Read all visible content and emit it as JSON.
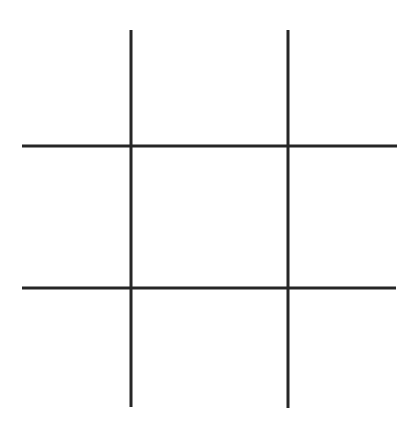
{
  "canvas": {
    "width": 414,
    "height": 429,
    "background_color": "#ffffff"
  },
  "board": {
    "name": "tic-tac-toe-grid",
    "rows": 3,
    "columns": 3,
    "marks_placed": 0,
    "state": "empty"
  },
  "style": {
    "line_color": "#262626",
    "line_width": 3,
    "line_cap": "butt"
  },
  "chart_data": {
    "type": "table",
    "title": "",
    "xlabel": "",
    "ylabel": "",
    "categories": [
      "column-left",
      "column-center",
      "column-right"
    ],
    "rows": [
      "row-top",
      "row-middle",
      "row-bottom"
    ],
    "cells": [
      [
        "",
        "",
        ""
      ],
      [
        "",
        "",
        ""
      ],
      [
        "",
        "",
        ""
      ]
    ],
    "grid": true,
    "legend": "none"
  },
  "lines": [
    {
      "name": "vertical-line-left",
      "orientation": "vertical",
      "x1": 131,
      "y1": 30,
      "x2": 131,
      "y2": 407
    },
    {
      "name": "vertical-line-right",
      "orientation": "vertical",
      "x1": 288,
      "y1": 30,
      "x2": 288,
      "y2": 408
    },
    {
      "name": "horizontal-line-top",
      "orientation": "horizontal",
      "x1": 22,
      "y1": 146,
      "x2": 397,
      "y2": 146
    },
    {
      "name": "horizontal-line-bottom",
      "orientation": "horizontal",
      "x1": 22,
      "y1": 288,
      "x2": 396,
      "y2": 288
    }
  ],
  "cells": [
    {
      "name": "cell-top-left",
      "mark": "",
      "x": 22,
      "y": 30,
      "w": 109,
      "h": 116
    },
    {
      "name": "cell-top-center",
      "mark": "",
      "x": 131,
      "y": 30,
      "w": 157,
      "h": 116
    },
    {
      "name": "cell-top-right",
      "mark": "",
      "x": 288,
      "y": 30,
      "w": 109,
      "h": 116
    },
    {
      "name": "cell-middle-left",
      "mark": "",
      "x": 22,
      "y": 146,
      "w": 109,
      "h": 142
    },
    {
      "name": "cell-middle-center",
      "mark": "",
      "x": 131,
      "y": 146,
      "w": 157,
      "h": 142
    },
    {
      "name": "cell-middle-right",
      "mark": "",
      "x": 288,
      "y": 146,
      "w": 109,
      "h": 142
    },
    {
      "name": "cell-bottom-left",
      "mark": "",
      "x": 22,
      "y": 288,
      "w": 109,
      "h": 120
    },
    {
      "name": "cell-bottom-center",
      "mark": "",
      "x": 131,
      "y": 288,
      "w": 157,
      "h": 120
    },
    {
      "name": "cell-bottom-right",
      "mark": "",
      "x": 288,
      "y": 288,
      "w": 109,
      "h": 120
    }
  ]
}
